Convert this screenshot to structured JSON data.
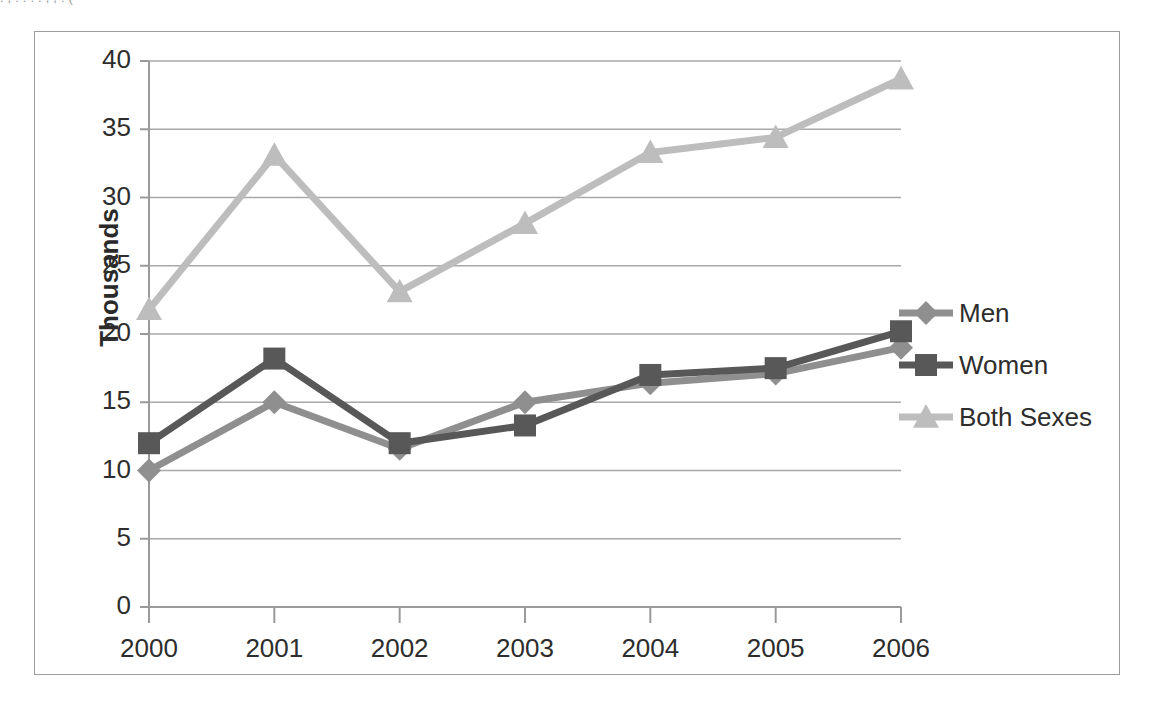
{
  "page": {
    "clipped_top_text": ". , . .         . .   ,    ,      .     ("
  },
  "chart_data": {
    "type": "line",
    "title": "",
    "subtitle": "",
    "xlabel": "",
    "ylabel": "Thousands",
    "categories": [
      "2000",
      "2001",
      "2002",
      "2003",
      "2004",
      "2005",
      "2006"
    ],
    "x": [
      2000,
      2001,
      2002,
      2003,
      2004,
      2005,
      2006
    ],
    "series": [
      {
        "name": "Men",
        "color": "#8f8f8f",
        "marker": "diamond",
        "values": [
          10.0,
          15.0,
          11.6,
          15.0,
          16.4,
          17.1,
          19.0
        ]
      },
      {
        "name": "Women",
        "color": "#585858",
        "marker": "square",
        "values": [
          12.0,
          18.2,
          12.0,
          13.3,
          17.0,
          17.5,
          20.2
        ]
      },
      {
        "name": "Both Sexes",
        "color": "#bdbdbd",
        "marker": "triangle",
        "values": [
          21.8,
          33.1,
          23.1,
          28.1,
          33.3,
          34.4,
          38.7
        ]
      }
    ],
    "ylim": [
      0,
      40
    ],
    "ytick_step": 5,
    "yticks": [
      "0",
      "5",
      "10",
      "15",
      "20",
      "25",
      "30",
      "35",
      "40"
    ],
    "grid": "horizontal",
    "legend_position": "right",
    "axis_color": "#9a9a9a",
    "grid_color": "#a8a8a8",
    "background": "#ffffff"
  },
  "legend": {
    "entries": [
      {
        "label": "Men",
        "color": "#8f8f8f",
        "marker": "diamond"
      },
      {
        "label": "Women",
        "color": "#585858",
        "marker": "square"
      },
      {
        "label": "Both Sexes",
        "color": "#bdbdbd",
        "marker": "triangle"
      }
    ]
  }
}
